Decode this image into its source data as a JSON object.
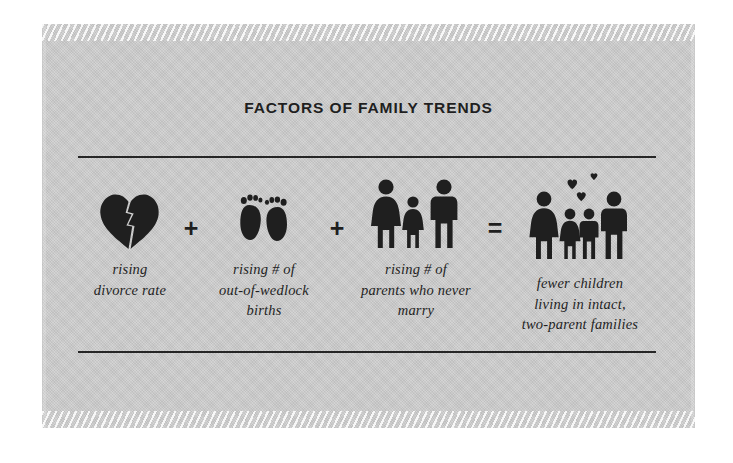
{
  "card": {
    "background_color": "#cfcfcf",
    "ink_color": "#1f1f1f"
  },
  "title": "FACTORS OF FAMILY TRENDS",
  "equation": {
    "terms": [
      {
        "icon": "broken-heart-icon",
        "caption_lines": [
          "rising",
          "divorce rate"
        ]
      },
      {
        "icon": "baby-footprints-icon",
        "caption_lines": [
          "rising # of",
          "out-of-wedlock",
          "births"
        ]
      },
      {
        "icon": "woman-child-man-icon",
        "caption_lines": [
          "rising # of",
          "parents who never",
          "marry"
        ]
      },
      {
        "icon": "family-with-hearts-icon",
        "caption_lines": [
          "fewer children",
          "living in intact,",
          "two-parent families"
        ]
      }
    ],
    "operators": [
      "+",
      "+",
      "="
    ]
  }
}
